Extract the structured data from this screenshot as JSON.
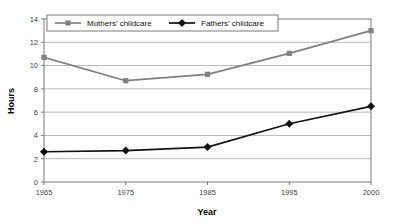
{
  "chart_data": {
    "type": "line",
    "title": "",
    "xlabel": "Year",
    "ylabel": "Hours",
    "categories": [
      "1965",
      "1975",
      "1985",
      "1995",
      "2000"
    ],
    "series": [
      {
        "name": "Mothers' childcare",
        "values": [
          10.7,
          8.7,
          9.25,
          11.05,
          13.0
        ],
        "color": "#808080",
        "marker": "square"
      },
      {
        "name": "Fathers' childcare",
        "values": [
          2.6,
          2.7,
          3.0,
          5.0,
          6.5
        ],
        "color": "#121212",
        "marker": "diamond"
      }
    ],
    "ylim": [
      0,
      14
    ],
    "yticks": [
      "0",
      "2",
      "4",
      "6",
      "8",
      "10",
      "12",
      "14"
    ],
    "ytick_values": [
      0,
      2,
      4,
      6,
      8,
      10,
      12,
      14
    ],
    "grid": true,
    "legend_position": "top-left-inside"
  },
  "legend": {
    "entries": [
      {
        "label": "Mothers' childcare"
      },
      {
        "label": "Fathers' childcare"
      }
    ]
  },
  "axes": {
    "x_title": "Year",
    "y_title": "Hours"
  }
}
